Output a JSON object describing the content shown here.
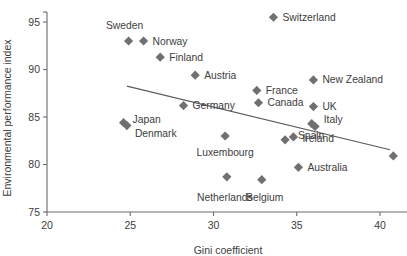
{
  "chart_data": {
    "type": "scatter",
    "title": "",
    "xlabel": "Gini coefficient",
    "ylabel": "Environmental performance index",
    "xlim": [
      20,
      41.6
    ],
    "ylim": [
      75,
      96.3
    ],
    "xticks": [
      "20",
      "25",
      "30",
      "35",
      "40"
    ],
    "xtick_values": [
      20,
      25,
      30,
      35,
      40
    ],
    "yticks": [
      "75",
      "80",
      "85",
      "90",
      "95"
    ],
    "ytick_values": [
      75,
      80,
      85,
      90,
      95
    ],
    "grid": false,
    "legend": "none",
    "marker_shape": "diamond",
    "marker_color": "#707070",
    "trendline": {
      "type": "linear",
      "x_start": 24.8,
      "y_start": 88.25,
      "x_end": 40.6,
      "y_end": 81.55,
      "color": "#5b5b5b"
    },
    "points": [
      {
        "name": "Switzerland",
        "x": 33.6,
        "y": 95.5,
        "label_dx": 9,
        "label_dy": 3.5,
        "label_anchor": "start"
      },
      {
        "name": "Sweden",
        "x": 24.9,
        "y": 93.0,
        "label_dx": -4,
        "label_dy": -12,
        "label_anchor": "middle"
      },
      {
        "name": "Norway",
        "x": 25.8,
        "y": 93.0,
        "label_dx": 9,
        "label_dy": 3.5,
        "label_anchor": "start"
      },
      {
        "name": "Finland",
        "x": 26.8,
        "y": 91.3,
        "label_dx": 9,
        "label_dy": 3.5,
        "label_anchor": "start"
      },
      {
        "name": "Austria",
        "x": 28.9,
        "y": 89.4,
        "label_dx": 9,
        "label_dy": 3.5,
        "label_anchor": "start"
      },
      {
        "name": "New Zealand",
        "x": 36.0,
        "y": 88.9,
        "label_dx": 9,
        "label_dy": 3.5,
        "label_anchor": "start"
      },
      {
        "name": "France",
        "x": 32.6,
        "y": 87.8,
        "label_dx": 9,
        "label_dy": 3.5,
        "label_anchor": "start"
      },
      {
        "name": "Canada",
        "x": 32.7,
        "y": 86.5,
        "label_dx": 9,
        "label_dy": 3.5,
        "label_anchor": "start"
      },
      {
        "name": "Germany",
        "x": 28.2,
        "y": 86.2,
        "label_dx": 9,
        "label_dy": 3.5,
        "label_anchor": "start"
      },
      {
        "name": "UK",
        "x": 36.0,
        "y": 86.1,
        "label_dx": 9,
        "label_dy": 3.5,
        "label_anchor": "start"
      },
      {
        "name": "Italy",
        "x": 35.9,
        "y": 84.3,
        "label_dx": 12,
        "label_dy": -1,
        "label_anchor": "start"
      },
      {
        "name": "Spain",
        "x": 36.1,
        "y": 84.0,
        "label_dx": -4,
        "label_dy": 12,
        "label_anchor": "middle"
      },
      {
        "name": "Japan",
        "x": 24.6,
        "y": 84.4,
        "label_dx": 9,
        "label_dy": 0,
        "label_anchor": "start"
      },
      {
        "name": "Denmark",
        "x": 24.8,
        "y": 84.1,
        "label_dx": 8,
        "label_dy": 11,
        "label_anchor": "start"
      },
      {
        "name": "Luxembourg",
        "x": 30.7,
        "y": 83.0,
        "label_dx": 0,
        "label_dy": 20,
        "label_anchor": "middle"
      },
      {
        "name": "Ireland",
        "x": 34.8,
        "y": 82.9,
        "label_dx": 9,
        "label_dy": 5,
        "label_anchor": "start"
      },
      {
        "name": "",
        "x": 34.3,
        "y": 82.6,
        "label_dx": 0,
        "label_dy": 0,
        "label_anchor": "middle"
      },
      {
        "name": "Australia",
        "x": 35.1,
        "y": 79.7,
        "label_dx": 9,
        "label_dy": 3.5,
        "label_anchor": "start"
      },
      {
        "name": "Netherlands",
        "x": 30.8,
        "y": 78.7,
        "label_dx": -2,
        "label_dy": 24,
        "label_anchor": "middle"
      },
      {
        "name": "Belgium",
        "x": 32.9,
        "y": 78.4,
        "label_dx": 3,
        "label_dy": 21,
        "label_anchor": "middle"
      },
      {
        "name": "",
        "x": 40.8,
        "y": 80.9,
        "label_dx": 0,
        "label_dy": 0,
        "label_anchor": "middle"
      }
    ]
  }
}
